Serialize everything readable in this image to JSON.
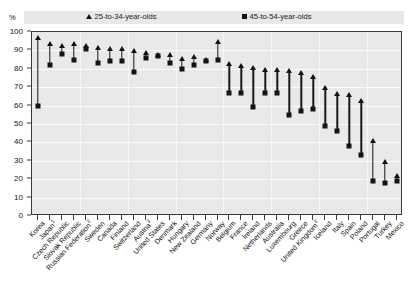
{
  "top_strip": {
    "clipped_text": "· · · · · · · · · · · ·"
  },
  "axis": {
    "unit_label": "%",
    "y_ticks": [
      "0",
      "10",
      "20",
      "30",
      "40",
      "50",
      "60",
      "70",
      "80",
      "90",
      "100"
    ]
  },
  "legend": {
    "young": {
      "label": "25-to-34-year-olds",
      "marker": "triangle-up-icon"
    },
    "old": {
      "label": "45-to-54-year-olds",
      "marker": "square-icon"
    }
  },
  "chart_data": {
    "type": "scatter",
    "title": "",
    "subtitle": "",
    "xlabel": "",
    "ylabel": "%",
    "ylim": [
      0,
      100
    ],
    "ytick_step": 10,
    "grid": true,
    "legend_position": "top",
    "categories": [
      "Korea",
      "Japan¹",
      "Czech Republic",
      "Slovak Republic",
      "Russian Federation²",
      "Sweden",
      "Canada",
      "Finland",
      "Switzerland",
      "Austria³",
      "United States",
      "Denmark",
      "Hungary",
      "New Zealand",
      "Germany",
      "Norway",
      "Belgium",
      "France",
      "Ireland",
      "Netherlands",
      "Australia",
      "Luxembourg",
      "Greece",
      "United Kingdom³",
      "Iceland",
      "Italy",
      "Spain",
      "Poland",
      "Portugal",
      "Turkey",
      "Mexico"
    ],
    "category_footnotes": {
      "Japan¹": "1",
      "Russian Federation²": "2",
      "Austria³": "3",
      "United Kingdom³": "3"
    },
    "series": [
      {
        "name": "25-to-34-year-olds",
        "marker": "triangle-up-icon",
        "values": [
          97,
          94,
          93,
          94,
          93,
          92,
          91,
          91,
          90,
          89,
          88,
          88,
          86,
          87,
          85,
          95,
          83,
          82,
          81,
          80,
          80,
          79,
          78,
          76,
          70,
          67,
          66,
          63,
          41,
          30,
          22
        ]
      },
      {
        "name": "45-to-54-year-olds",
        "marker": "square-icon",
        "values": [
          60,
          82,
          88,
          85,
          91,
          83,
          84,
          84,
          78,
          86,
          87,
          83,
          80,
          82,
          84,
          85,
          67,
          67,
          59,
          67,
          67,
          55,
          57,
          58,
          49,
          46,
          38,
          33,
          19,
          18,
          19
        ]
      }
    ]
  }
}
